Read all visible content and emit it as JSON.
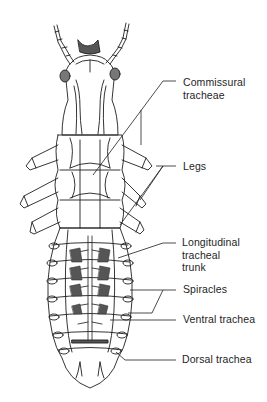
{
  "figure": {
    "line_color": "#1e1e1e",
    "fill_dark": "#555555",
    "background": "#ffffff"
  },
  "labels": [
    {
      "id": "commissural-tracheae",
      "text": "Commissural\ntracheae",
      "x": 183,
      "y": 76
    },
    {
      "id": "legs",
      "text": "Legs",
      "x": 183,
      "y": 160
    },
    {
      "id": "longitudinal-tracheal-trunk",
      "text": "Longitudinal\ntracheal\ntrunk",
      "x": 182,
      "y": 236
    },
    {
      "id": "spiracles",
      "text": "Spiracles",
      "x": 183,
      "y": 283
    },
    {
      "id": "ventral-trachea",
      "text": "Ventral trachea",
      "x": 183,
      "y": 313
    },
    {
      "id": "dorsal-trachea",
      "text": "Dorsal trachea",
      "x": 182,
      "y": 353
    }
  ],
  "leaders": {
    "commissural_tracheae": {
      "from": [
        176,
        81
      ],
      "bend": [
        163,
        81
      ],
      "targets": [
        [
          93,
          175
        ],
        [
          141,
          145
        ]
      ]
    },
    "legs": {
      "from": [
        176,
        166
      ],
      "bend": [
        163,
        166
      ],
      "targets": [
        [
          146,
          168
        ],
        [
          138,
          200
        ],
        [
          118,
          225
        ]
      ]
    },
    "longitudinal_tracheal_trunk": {
      "from": [
        176,
        243
      ],
      "bend": [
        163,
        243
      ],
      "targets": [
        [
          118,
          258
        ]
      ]
    },
    "spiracles": {
      "from": [
        176,
        290
      ],
      "bend": [
        163,
        290
      ],
      "targets": [
        [
          130,
          290
        ],
        [
          130,
          313
        ]
      ]
    },
    "ventral_trachea": {
      "from": [
        176,
        320
      ],
      "targets": [
        [
          110,
          320
        ]
      ]
    },
    "dorsal_trachea": {
      "from": [
        176,
        360
      ],
      "targets": [
        [
          125,
          360
        ],
        [
          115,
          352
        ]
      ]
    }
  }
}
